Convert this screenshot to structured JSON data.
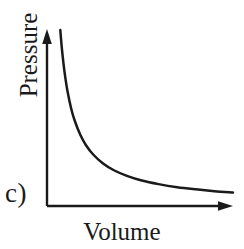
{
  "figure": {
    "panel_label": "c)",
    "background_color": "#ffffff",
    "ink_color": "#1a1a1a"
  },
  "chart_data": {
    "type": "line",
    "title": "",
    "subtitle": "",
    "xlabel": "Volume",
    "ylabel": "Pressure",
    "annotations": [
      "c)"
    ],
    "legend": [],
    "legend_position": "none",
    "grid": false,
    "axis_style": "arrow-headed L-shaped axes, no tick marks, no numeric tick labels",
    "xticks": [],
    "yticks": [],
    "xlim": [
      0,
      10
    ],
    "ylim": [
      0,
      10
    ],
    "relationship": "inverse (Boyle's law): P = k / V",
    "series": [
      {
        "name": "Pressure vs Volume",
        "color": "#1a1a1a",
        "x": [
          0.72,
          0.78,
          0.85,
          0.95,
          1.1,
          1.3,
          1.5,
          1.8,
          2.1,
          2.5,
          3.0,
          3.6,
          4.3,
          5.1,
          6.0,
          7.0,
          8.0,
          9.0,
          10.0
        ],
        "y": [
          9.72,
          8.97,
          8.24,
          7.37,
          6.36,
          5.38,
          4.67,
          3.89,
          3.33,
          2.8,
          2.33,
          1.94,
          1.63,
          1.37,
          1.17,
          1.0,
          0.88,
          0.78,
          0.7
        ]
      }
    ]
  }
}
